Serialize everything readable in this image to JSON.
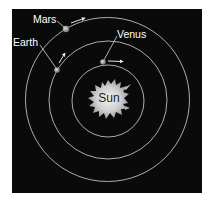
{
  "diagram": {
    "type": "solar-system-orbits",
    "background_color": "#0a0a0a",
    "orbit_color": "#bdbdbd",
    "center": {
      "label": "Sun"
    },
    "planets": [
      {
        "label": "Venus",
        "orbit": "inner"
      },
      {
        "label": "Earth",
        "orbit": "middle"
      },
      {
        "label": "Mars",
        "orbit": "outer"
      }
    ]
  }
}
